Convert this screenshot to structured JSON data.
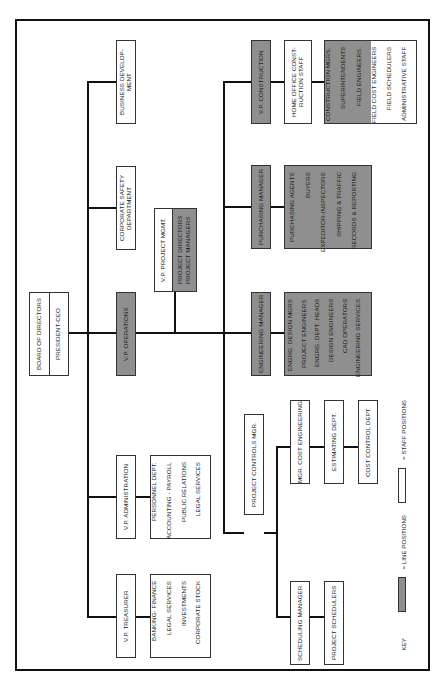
{
  "chart": {
    "orientation": "rotated-90-ccw",
    "root": {
      "top_label": "BOARD OF DIRECTORS",
      "bottom_label": "PRESIDENT-CEO"
    },
    "staff_offices": {
      "business_development": "BUSINESS DEVELOP-\nMENT",
      "corporate_safety": "CORPORATE SAFETY\nDEPARTMENT",
      "vp_operations": "V.P. OPERATIONS",
      "vp_administration": "V.P. ADMINISTRATION",
      "vp_treasurer": "V.P. TREASURER"
    },
    "administration_items": [
      "PERSONNEL DEPT.",
      "ACCOUNTING - PAYROLL",
      "PUBLIC RELATIONS",
      "LEGAL SERVICES"
    ],
    "treasurer_items": [
      "BANKING- FINANCE",
      "LEGAL SERVICES",
      "INVESTMENTS",
      "CORPORATE STOCK"
    ],
    "project_mgmt": {
      "title": "V.P. PROJECT MGMT.",
      "items": [
        "PROJECT DIRECTORS",
        "PROJECT MANAGERS"
      ]
    },
    "construction": {
      "title": "V.P. CONSTRUCTION",
      "home_office": "HOME OFFICE CONST-\nRUCTION STAFF",
      "line_items": [
        "CONSTRUCTION MGRS.",
        "SUPERINTENDENTS",
        "FIELD ENGINEERS."
      ],
      "staff_items": [
        "FIELD COST ENGINEERS",
        "FIELD SCHEDULERS",
        "ADMINISTRATIVE STAFF"
      ]
    },
    "purchasing": {
      "title": "PURCHASING MANAGER",
      "items": [
        "PURCHASING AGENTS",
        "BUYERS",
        "EXPEDITOR-INSPECTORS",
        "SHIPPING & TRAFFIC",
        "RECORDS & REPORTING"
      ]
    },
    "engineering": {
      "title": "ENGINEERING MANAGER",
      "items": [
        "ENGRG. DESIGN MGRS",
        "PROJECT ENGINEERS",
        "ENGRG. DEPT. HEADS",
        "DESIGN ENGINEERS",
        "CAD OPERATORS",
        "ENGINEERING SERVICES"
      ]
    },
    "project_controls": {
      "title": "PROJECT CONTROLS MGR.",
      "cost_engineering": "MGR. COST ENGINEERING",
      "estimating": "ESTIMATING DEPT.",
      "cost_control": "COST CONTROL DEPT.",
      "scheduling_manager": "SCHEDULING MANAGER",
      "project_schedulers": "PROJECT SCHEDULERS"
    },
    "key": {
      "label": "KEY",
      "line_positions": "= LINE POSITIONS",
      "staff_positions": "= STAFF POSITIONS"
    },
    "colors": {
      "line_fill": "#8f8f8f",
      "staff_fill": "#ffffff",
      "connector": "#111111"
    }
  }
}
